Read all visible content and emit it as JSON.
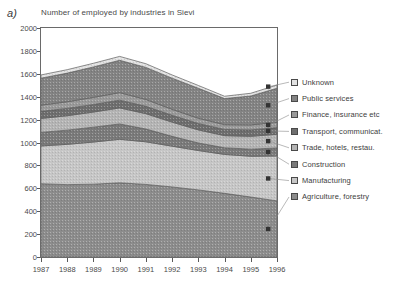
{
  "panel": {
    "label": "a)"
  },
  "chart_data": {
    "type": "area",
    "title": "Number of employed by industries in Sievi",
    "xlabel": "",
    "ylabel": "",
    "stacked": true,
    "grid": false,
    "legend_position": "right",
    "categories": [
      "1987",
      "1988",
      "1989",
      "1990",
      "1991",
      "1992",
      "1993",
      "1994",
      "1995",
      "1996"
    ],
    "x": [
      1987,
      1988,
      1989,
      1990,
      1991,
      1992,
      1993,
      1994,
      1995,
      1996
    ],
    "ylim": [
      0,
      2000
    ],
    "yticks": [
      0,
      200,
      400,
      600,
      800,
      1000,
      1200,
      1400,
      1600,
      1800,
      2000
    ],
    "series": [
      {
        "name": "Agriculture, forestry",
        "color": "#8c8c8c",
        "values": [
          640,
          632,
          636,
          648,
          634,
          612,
          586,
          556,
          524,
          490
        ]
      },
      {
        "name": "Manufacturing",
        "color": "#c6c6c6",
        "values": [
          330,
          352,
          368,
          380,
          372,
          356,
          344,
          340,
          356,
          392
        ]
      },
      {
        "name": "Construction",
        "color": "#7a7a7a",
        "values": [
          118,
          124,
          130,
          134,
          112,
          86,
          66,
          58,
          62,
          70
        ]
      },
      {
        "name": "Trade, hotels, restau.",
        "color": "#b4b4b4",
        "values": [
          122,
          126,
          132,
          140,
          134,
          124,
          114,
          106,
          112,
          120
        ]
      },
      {
        "name": "Transport, communicat.",
        "color": "#6e6e6e",
        "values": [
          62,
          64,
          66,
          68,
          64,
          60,
          56,
          54,
          56,
          58
        ]
      },
      {
        "name": "Finance, insurance etc",
        "color": "#9a9a9a",
        "values": [
          54,
          58,
          62,
          66,
          60,
          52,
          46,
          42,
          44,
          46
        ]
      },
      {
        "name": "Public services",
        "color": "#838383",
        "values": [
          236,
          250,
          266,
          282,
          280,
          272,
          262,
          228,
          252,
          298
        ]
      },
      {
        "name": "Unknown",
        "color": "#e2e2e2",
        "values": [
          28,
          30,
          32,
          34,
          32,
          28,
          24,
          20,
          24,
          28
        ]
      }
    ],
    "totals": [
      1590,
      1636,
      1692,
      1752,
      1688,
      1590,
      1498,
      1404,
      1430,
      1502
    ]
  },
  "legend": {
    "items": [
      {
        "label": "Unknown",
        "color": "#e2e2e2"
      },
      {
        "label": "Public services",
        "color": "#838383"
      },
      {
        "label": "Finance, insurance etc",
        "color": "#9a9a9a"
      },
      {
        "label": "Transport, communicat.",
        "color": "#6e6e6e"
      },
      {
        "label": "Trade, hotels, restau.",
        "color": "#b4b4b4"
      },
      {
        "label": "Construction",
        "color": "#7a7a7a"
      },
      {
        "label": "Manufacturing",
        "color": "#c6c6c6"
      },
      {
        "label": "Agriculture, forestry",
        "color": "#8c8c8c"
      }
    ]
  }
}
